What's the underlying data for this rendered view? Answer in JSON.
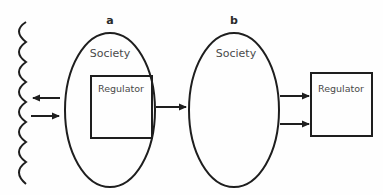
{
  "diagram": {
    "colors": {
      "stroke": "#1e1e1e",
      "text": "#4a4a4a",
      "background": "#fefefe"
    },
    "environment": {
      "shape": "wavy-line",
      "arrows": [
        {
          "direction": "left",
          "meaning": "society-to-environment"
        },
        {
          "direction": "right",
          "meaning": "environment-to-society"
        }
      ]
    },
    "panel_a": {
      "label": "a",
      "society_label": "Society",
      "regulator_label": "Regulator",
      "regulator_position": "inside-society",
      "outgoing_arrow": "to-panel-b"
    },
    "panel_b": {
      "label": "b",
      "society_label": "Society",
      "regulator_label": "Regulator",
      "regulator_position": "outside-society",
      "arrows_to_regulator": 2
    }
  }
}
